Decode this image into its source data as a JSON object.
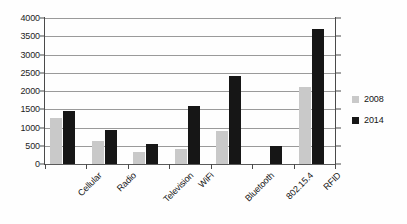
{
  "chart_data": {
    "type": "bar",
    "title": "",
    "subtitle": "",
    "xlabel": "",
    "ylabel": "",
    "ylim": [
      0,
      4000
    ],
    "ytick_step": 500,
    "yticks": [
      "0",
      "500",
      "1000",
      "1500",
      "2000",
      "2500",
      "3000",
      "3500",
      "4000"
    ],
    "ytick_values": [
      0,
      500,
      1000,
      1500,
      2000,
      2500,
      3000,
      3500,
      4000
    ],
    "grid": "horizontal",
    "legend_position": "right",
    "categories": [
      "Cellular",
      "Radio",
      "Television",
      "WiFi",
      "Bluetooth",
      "802.15.4",
      "RFID"
    ],
    "series": [
      {
        "name": "2008",
        "color": "#c9c9c9",
        "values": [
          1250,
          640,
          320,
          400,
          900,
          0,
          2100
        ]
      },
      {
        "name": "2014",
        "color": "#161616",
        "values": [
          1450,
          940,
          550,
          1600,
          2400,
          500,
          3700
        ]
      }
    ],
    "annotations": []
  },
  "legend": {
    "items": [
      {
        "label": "2008",
        "series_index": 0
      },
      {
        "label": "2014",
        "series_index": 1
      }
    ]
  }
}
